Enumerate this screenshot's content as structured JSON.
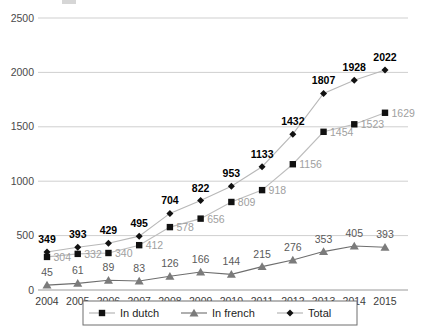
{
  "chart_data": {
    "type": "line",
    "title": "",
    "xlabel": "",
    "ylabel": "",
    "ylim": [
      0,
      2500
    ],
    "yticks": [
      0,
      500,
      1000,
      1500,
      2000,
      2500
    ],
    "grid": true,
    "legend_position": "bottom",
    "categories": [
      "2004",
      "2005",
      "2006",
      "2007",
      "2008",
      "2009",
      "2010",
      "2011",
      "2012",
      "2013",
      "2014",
      "2015"
    ],
    "series": [
      {
        "name": "In dutch",
        "marker": "square",
        "values": [
          304,
          332,
          340,
          412,
          578,
          656,
          809,
          918,
          1156,
          1454,
          1523,
          1629
        ]
      },
      {
        "name": "In french",
        "marker": "triangle",
        "values": [
          45,
          61,
          89,
          83,
          126,
          166,
          144,
          215,
          276,
          353,
          405,
          393
        ]
      },
      {
        "name": "Total",
        "marker": "diamond",
        "values": [
          349,
          393,
          429,
          495,
          704,
          822,
          953,
          1133,
          1432,
          1807,
          1928,
          2022
        ]
      }
    ]
  },
  "legend": {
    "items": [
      {
        "label": "In dutch",
        "marker": "square"
      },
      {
        "label": "In french",
        "marker": "triangle"
      },
      {
        "label": "Total",
        "marker": "diamond"
      }
    ]
  },
  "colors": {
    "total_marker": "#111111",
    "dutch_marker": "#111111",
    "french_marker": "#7b7b7b",
    "total_line": "#b8b8b8",
    "dutch_line": "#bdbdbd",
    "french_line": "#6e6e6e",
    "grid": "#cfcfcf",
    "axis": "#9a9a9a",
    "dutch_label": "#a0a0a0",
    "french_label": "#5a5a5a",
    "total_label": "#000000",
    "background": "#ffffff"
  }
}
